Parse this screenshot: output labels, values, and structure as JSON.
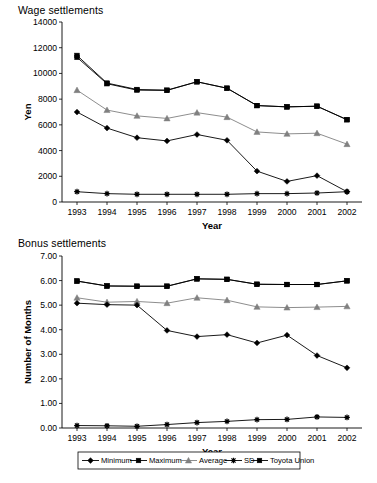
{
  "figure": {
    "panels": [
      {
        "title": "Wage settlements"
      },
      {
        "title": "Bonus settlements"
      }
    ],
    "legend": {
      "position": "bottom",
      "entries": [
        {
          "label": "Minimum",
          "marker": "diamond",
          "color": "#000000"
        },
        {
          "label": "Maximum",
          "marker": "square",
          "color": "#000000"
        },
        {
          "label": "Average",
          "marker": "triangle",
          "color": "#808080"
        },
        {
          "label": "SD",
          "marker": "asterisk",
          "color": "#000000"
        },
        {
          "label": "Toyota Union",
          "marker": "square",
          "color": "#000000"
        }
      ]
    }
  },
  "chart_data": [
    {
      "type": "line",
      "title": "Wage settlements",
      "xlabel": "Year",
      "ylabel": "Yen",
      "x": [
        1993,
        1994,
        1995,
        1996,
        1997,
        1998,
        1999,
        2000,
        2001,
        2002
      ],
      "categories": [
        "1993",
        "1994",
        "1995",
        "1996",
        "1997",
        "1998",
        "1999",
        "2000",
        "2001",
        "2002"
      ],
      "ylim": [
        0,
        14000
      ],
      "yticks": [
        0,
        2000,
        4000,
        6000,
        8000,
        10000,
        12000,
        14000
      ],
      "ytick_labels": [
        "0",
        "2000",
        "4000",
        "6000",
        "8000",
        "10000",
        "12000",
        "14000"
      ],
      "grid": false,
      "legend_position": "bottom",
      "series": [
        {
          "name": "Minimum",
          "marker": "diamond",
          "color": "#000000",
          "values": [
            7000,
            5750,
            5000,
            4750,
            5250,
            4800,
            2400,
            1600,
            2050,
            800
          ]
        },
        {
          "name": "Maximum",
          "marker": "square",
          "color": "#000000",
          "values": [
            11400,
            9250,
            8750,
            8700,
            9350,
            8850,
            7500,
            7400,
            7450,
            6400
          ]
        },
        {
          "name": "Average",
          "marker": "triangle",
          "color": "#808080",
          "values": [
            8700,
            7150,
            6700,
            6500,
            6950,
            6600,
            5450,
            5300,
            5350,
            4500
          ]
        },
        {
          "name": "SD",
          "marker": "asterisk",
          "color": "#000000",
          "values": [
            800,
            650,
            600,
            600,
            600,
            600,
            650,
            650,
            700,
            800
          ]
        },
        {
          "name": "Toyota Union",
          "marker": "square",
          "color": "#000000",
          "values": [
            11250,
            9200,
            8700,
            8680,
            9350,
            8850,
            7500,
            7400,
            7450,
            6400
          ]
        }
      ]
    },
    {
      "type": "line",
      "title": "Bonus settlements",
      "xlabel": "Year",
      "ylabel": "Number of Months",
      "x": [
        1993,
        1994,
        1995,
        1996,
        1997,
        1998,
        1999,
        2000,
        2001,
        2002
      ],
      "categories": [
        "1993",
        "1994",
        "1995",
        "1996",
        "1997",
        "1998",
        "1999",
        "2000",
        "2001",
        "2002"
      ],
      "ylim": [
        0,
        7
      ],
      "yticks": [
        0,
        1,
        2,
        3,
        4,
        5,
        6,
        7
      ],
      "ytick_labels": [
        "0.00",
        "1.00",
        "2.00",
        "3.00",
        "4.00",
        "5.00",
        "6.00",
        "7.00"
      ],
      "grid": false,
      "legend_position": "bottom",
      "series": [
        {
          "name": "Minimum",
          "marker": "diamond",
          "color": "#000000",
          "values": [
            5.08,
            5.02,
            5.0,
            3.97,
            3.72,
            3.8,
            3.46,
            3.78,
            2.95,
            2.45
          ]
        },
        {
          "name": "Maximum",
          "marker": "square",
          "color": "#000000",
          "values": [
            5.98,
            5.78,
            5.77,
            5.77,
            6.07,
            6.05,
            5.85,
            5.84,
            5.84,
            5.99
          ]
        },
        {
          "name": "Average",
          "marker": "triangle",
          "color": "#808080",
          "values": [
            5.3,
            5.12,
            5.15,
            5.08,
            5.3,
            5.2,
            4.93,
            4.9,
            4.92,
            4.95
          ]
        },
        {
          "name": "SD",
          "marker": "asterisk",
          "color": "#000000",
          "values": [
            0.1,
            0.09,
            0.07,
            0.14,
            0.22,
            0.27,
            0.34,
            0.35,
            0.45,
            0.43
          ]
        },
        {
          "name": "Toyota Union",
          "marker": "square",
          "color": "#000000",
          "values": [
            5.98,
            5.78,
            5.77,
            5.77,
            6.07,
            6.05,
            5.85,
            5.84,
            5.84,
            5.99
          ]
        }
      ]
    }
  ]
}
